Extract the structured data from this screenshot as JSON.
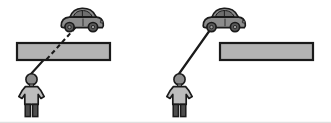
{
  "figure": {
    "width": 331,
    "height": 123,
    "background": "#ffffff",
    "panel_count": 2
  },
  "colors": {
    "outline": "#1a1a1a",
    "barrier_fill": "#b3b3b3",
    "car_body_fill": "#8c8c8c",
    "car_window_fill": "#6e6e6e",
    "car_wheel_fill": "#5a5a5a",
    "person_head_fill": "#8c8c8c",
    "person_body_fill": "#bdbdbd",
    "person_leg_fill": "#4d4d4d",
    "sightline": "#1a1a1a",
    "baseline": "#d9d9d9"
  },
  "panels": [
    {
      "id": "left-panel",
      "name": "occluded-view",
      "label": "",
      "sightline": {
        "style": "dashed",
        "name": "sight-line-dashed",
        "from": "observer-eye",
        "to": "car",
        "description": "dashed line passes through the barrier"
      },
      "barrier": {
        "name": "barrier-bar",
        "x": 17,
        "y": 43,
        "width": 93,
        "height": 17,
        "description": "horizontal gray bar blocking view"
      },
      "car": {
        "name": "car",
        "x": 59,
        "y": 7,
        "width": 45,
        "height": 25,
        "facing": "right"
      },
      "person": {
        "name": "observer-person",
        "x": 18,
        "y": 73,
        "width": 27,
        "height": 44,
        "facing": "front"
      }
    },
    {
      "id": "right-panel",
      "name": "clear-view",
      "label": "",
      "sightline": {
        "style": "solid",
        "name": "sight-line-solid",
        "from": "observer-eye",
        "to": "car",
        "description": "solid line passes above and left of the barrier"
      },
      "barrier": {
        "name": "barrier-bar",
        "x": 220,
        "y": 43,
        "width": 93,
        "height": 17,
        "description": "horizontal gray bar not blocking view"
      },
      "car": {
        "name": "car",
        "x": 201,
        "y": 7,
        "width": 45,
        "height": 25,
        "facing": "right"
      },
      "person": {
        "name": "observer-person",
        "x": 166,
        "y": 73,
        "width": 27,
        "height": 44,
        "facing": "front"
      }
    }
  ],
  "icons": {
    "car": "car-icon",
    "person": "person-icon",
    "barrier": "barrier-icon",
    "sightline_dashed": "dashed-line-icon",
    "sightline_solid": "solid-line-icon"
  }
}
